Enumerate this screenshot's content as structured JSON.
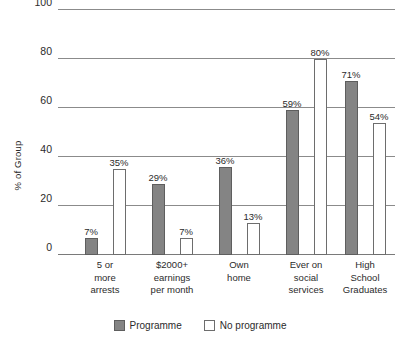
{
  "chart_data": {
    "type": "bar",
    "title": "",
    "xlabel": "",
    "ylabel": "% of Group",
    "ylim": [
      0,
      100
    ],
    "yticks": [
      0,
      20,
      40,
      60,
      80,
      100
    ],
    "ytick_labels": [
      "0",
      "20",
      "40",
      "60",
      "80",
      "100"
    ],
    "grid": true,
    "legend_position": "bottom",
    "categories": [
      "5 or\nmore\narrests",
      "$2000+\nearnings\nper month",
      "Own\nhome",
      "Ever on\nsocial\nservices",
      "High\nSchool\nGraduates"
    ],
    "category_lines": [
      [
        "5 or",
        "more",
        "arrests"
      ],
      [
        "$2000+",
        "earnings",
        "per month"
      ],
      [
        "Own",
        "home"
      ],
      [
        "Ever on",
        "social",
        "services"
      ],
      [
        "High",
        "School",
        "Graduates"
      ]
    ],
    "series": [
      {
        "name": "Programme",
        "color": "#848484",
        "values": [
          7,
          29,
          36,
          59,
          71
        ],
        "labels": [
          "7%",
          "29%",
          "36%",
          "59%",
          "71%"
        ]
      },
      {
        "name": "No programme",
        "color": "#ffffff",
        "values": [
          35,
          7,
          13,
          80,
          54
        ],
        "labels": [
          "35%",
          "7%",
          "13%",
          "80%",
          "54%"
        ]
      }
    ]
  },
  "axis": {
    "y_title": "% of Group",
    "ticks": [
      "100",
      "80",
      "60",
      "40",
      "20",
      "0"
    ]
  },
  "legend": {
    "items": [
      {
        "label": "Programme",
        "style": "programme"
      },
      {
        "label": "No programme",
        "style": "noprogramme"
      }
    ]
  }
}
